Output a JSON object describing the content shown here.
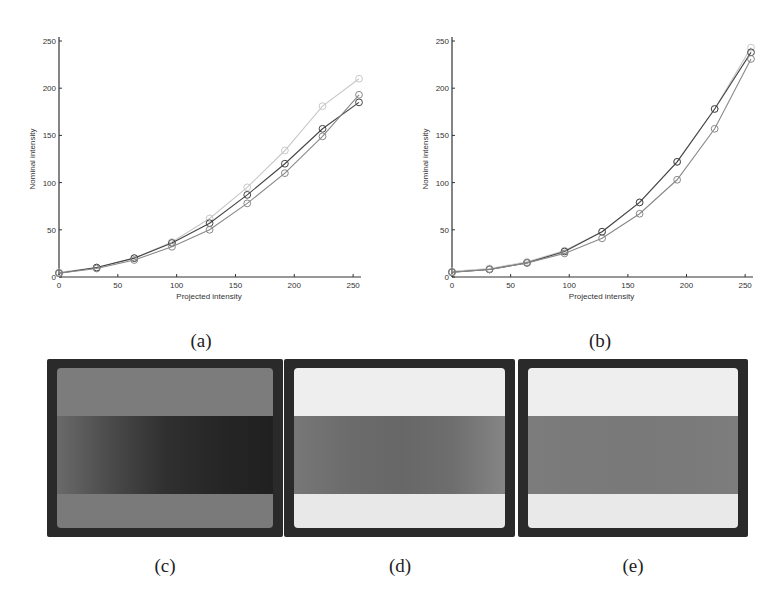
{
  "figure": {
    "captions": {
      "a": "(a)",
      "b": "(b)",
      "c": "(c)",
      "d": "(d)",
      "e": "(e)"
    }
  },
  "chart_data": [
    {
      "id": "a",
      "type": "line",
      "title": "",
      "xlabel": "Projected intensity",
      "ylabel": "Nominal intensity",
      "xlim": [
        0,
        255
      ],
      "ylim": [
        0,
        250
      ],
      "xticks": [
        0,
        50,
        100,
        150,
        200,
        250
      ],
      "yticks": [
        0,
        50,
        100,
        150,
        200,
        250
      ],
      "grid": false,
      "legend": null,
      "marker": "circle",
      "x": [
        0,
        32,
        64,
        96,
        128,
        160,
        192,
        224,
        255
      ],
      "series": [
        {
          "name": "light",
          "color": "#c8c8c8",
          "values": [
            5,
            10,
            20,
            37,
            62,
            95,
            134,
            181,
            210
          ]
        },
        {
          "name": "dark",
          "color": "#444444",
          "values": [
            4,
            10,
            20,
            36,
            57,
            87,
            120,
            157,
            185
          ]
        },
        {
          "name": "medium",
          "color": "#888888",
          "values": [
            4,
            9,
            18,
            32,
            50,
            78,
            110,
            149,
            193
          ]
        }
      ]
    },
    {
      "id": "b",
      "type": "line",
      "title": "",
      "xlabel": "Projected intensity",
      "ylabel": "Nominal intensity",
      "xlim": [
        0,
        255
      ],
      "ylim": [
        0,
        250
      ],
      "xticks": [
        0,
        50,
        100,
        150,
        200,
        250
      ],
      "yticks": [
        0,
        50,
        100,
        150,
        200,
        250
      ],
      "grid": false,
      "legend": null,
      "marker": "circle",
      "x": [
        0,
        32,
        64,
        96,
        128,
        160,
        192,
        224,
        255
      ],
      "series": [
        {
          "name": "light",
          "color": "#c8c8c8",
          "values": [
            6,
            9,
            16,
            28,
            48,
            79,
            122,
            178,
            243
          ]
        },
        {
          "name": "dark",
          "color": "#444444",
          "values": [
            5,
            8,
            15,
            27,
            48,
            79,
            122,
            178,
            238
          ]
        },
        {
          "name": "medium",
          "color": "#888888",
          "values": [
            5,
            8,
            15,
            25,
            41,
            67,
            103,
            157,
            231
          ]
        }
      ]
    }
  ],
  "photos": [
    {
      "id": "c",
      "top": "#7c7c7c",
      "middle": [
        "#6a6a6a",
        "#4a4a4a",
        "#303030",
        "#262626",
        "#202020"
      ],
      "bottom": "#7a7a7a"
    },
    {
      "id": "d",
      "top": "#eeeeee",
      "middle": [
        "#777777",
        "#6c6c6c",
        "#676767",
        "#6e6e6e",
        "#858585"
      ],
      "bottom": "#e8e8e8"
    },
    {
      "id": "e",
      "top": "#eeeeee",
      "middle": [
        "#7c7c7c",
        "#7a7a7a",
        "#797979",
        "#7a7a7a",
        "#7d7d7d"
      ],
      "bottom": "#e9e9e9"
    }
  ]
}
